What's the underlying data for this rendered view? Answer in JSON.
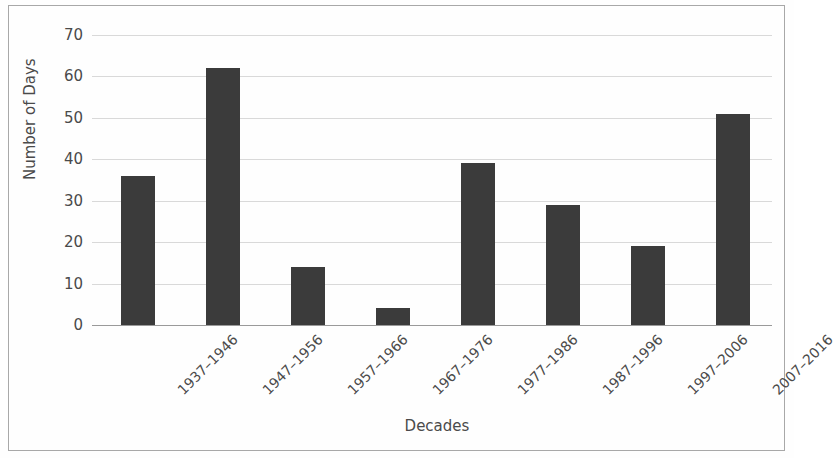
{
  "chart_data": {
    "type": "bar",
    "title": "",
    "xlabel": "Decades",
    "ylabel": "Number of Days",
    "categories": [
      "1937–1946",
      "1947–1956",
      "1957–1966",
      "1967–1976",
      "1977–1986",
      "1987–1996",
      "1997–2006",
      "2007–2016"
    ],
    "values": [
      36,
      62,
      14,
      4,
      39,
      29,
      19,
      51
    ],
    "ylim": [
      0,
      70
    ],
    "yticks": [
      0,
      10,
      20,
      30,
      40,
      50,
      60,
      70
    ],
    "ytick_labels": [
      "0",
      "10",
      "20",
      "30",
      "40",
      "50",
      "60",
      "70"
    ],
    "grid": true,
    "legend": false,
    "bar_color": "#3b3b3b",
    "grid_color": "#d9d9d9",
    "axis_color": "#9a9a9a",
    "text_color": "#4a4a4a",
    "border_color": "#a8a8a8"
  }
}
